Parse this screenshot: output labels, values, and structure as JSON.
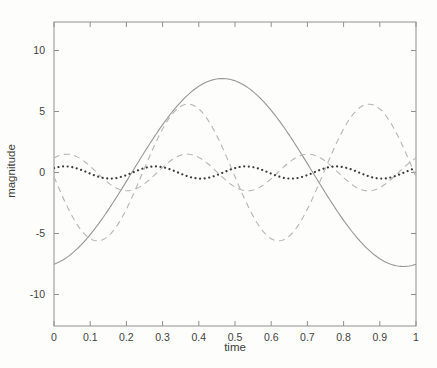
{
  "figure": {
    "background_color": "#fdfdfb",
    "axis_color": "#909090",
    "text_color": "#3d3d3d"
  },
  "chart_data": {
    "type": "line",
    "title": "",
    "xlabel": "time",
    "ylabel": "magnitude",
    "xlim": [
      0,
      1
    ],
    "ylim": [
      -12.5,
      12.3
    ],
    "grid": false,
    "legend": "none",
    "box": true,
    "tick_direction": "in",
    "x_tick_labels": [
      "0",
      "0.1",
      "0.2",
      "0.3",
      "0.4",
      "0.5",
      "0.6",
      "0.7",
      "0.8",
      "0.9",
      "1"
    ],
    "x_tick_values": [
      0,
      0.1,
      0.2,
      0.3,
      0.4,
      0.5,
      0.6,
      0.7,
      0.8,
      0.9,
      1
    ],
    "y_tick_labels": [
      "10",
      "5",
      "0",
      "-5",
      "-10"
    ],
    "y_tick_values": [
      10,
      5,
      0,
      -5,
      -10
    ],
    "model": "y = amplitude * sin(2*pi*frequency_hz*t + phase_rad), t in [0,1]",
    "series": [
      {
        "name": "sinusoid-1hz",
        "style": "solid",
        "color": "#969696",
        "amplitude": 7.7,
        "frequency_hz": 1,
        "phase_rad": -1.351,
        "samples_t": [
          0,
          0.05,
          0.1,
          0.15,
          0.2,
          0.25,
          0.3,
          0.35,
          0.4,
          0.45,
          0.5,
          0.55,
          0.6,
          0.65,
          0.7,
          0.75,
          0.8,
          0.85,
          0.9,
          0.95,
          1
        ],
        "samples_y": [
          -7.52,
          -6.63,
          -5.09,
          -3.06,
          -0.73,
          1.68,
          3.92,
          5.77,
          7.07,
          7.67,
          7.51,
          6.63,
          5.09,
          3.06,
          0.73,
          -1.68,
          -3.92,
          -5.77,
          -7.07,
          -7.67,
          -7.52
        ]
      },
      {
        "name": "sinusoid-2hz",
        "style": "dashed",
        "color": "#b5b5b5",
        "amplitude": 5.6,
        "frequency_hz": 2,
        "phase_rad": -3.079,
        "samples_t": [
          0,
          0.05,
          0.1,
          0.15,
          0.2,
          0.25,
          0.3,
          0.35,
          0.4,
          0.45,
          0.5,
          0.55,
          0.6,
          0.65,
          0.7,
          0.75,
          0.8,
          0.85,
          0.9,
          0.95,
          1
        ],
        "samples_y": [
          -0.35,
          -3.57,
          -5.42,
          -5.21,
          -3.0,
          0.35,
          3.57,
          5.42,
          5.21,
          3.0,
          -0.35,
          -3.57,
          -5.42,
          -5.21,
          -3.0,
          0.35,
          3.57,
          5.42,
          5.21,
          3.0,
          -0.35
        ]
      },
      {
        "name": "sinusoid-3hz",
        "style": "dashed",
        "color": "#b5b5b5",
        "amplitude": 1.5,
        "frequency_hz": 3,
        "phase_rad": 0.911,
        "samples_t": [
          0,
          0.05,
          0.1,
          0.15,
          0.2,
          0.25,
          0.3,
          0.35,
          0.4,
          0.45,
          0.5,
          0.55,
          0.6,
          0.65,
          0.7,
          0.75,
          0.8,
          0.85,
          0.9,
          0.95,
          1
        ],
        "samples_y": [
          1.19,
          1.44,
          0.51,
          -0.84,
          -1.5,
          -0.94,
          0.42,
          1.41,
          1.24,
          0.05,
          -1.19,
          -1.44,
          -0.51,
          0.84,
          1.5,
          0.92,
          -0.42,
          -1.41,
          -1.24,
          -0.05,
          1.19
        ]
      },
      {
        "name": "sinusoid-4hz",
        "style": "dotted",
        "color": "#3c3c3c",
        "amplitude": 0.5,
        "frequency_hz": 4,
        "phase_rad": 0.817,
        "samples_t": [
          0,
          0.05,
          0.1,
          0.15,
          0.2,
          0.25,
          0.3,
          0.35,
          0.4,
          0.45,
          0.5,
          0.55,
          0.6,
          0.65,
          0.7,
          0.75,
          0.8,
          0.85,
          0.9,
          0.95,
          1
        ],
        "samples_y": [
          0.36,
          0.44,
          -0.09,
          -0.5,
          -0.21,
          0.36,
          0.44,
          -0.09,
          -0.5,
          -0.21,
          0.36,
          0.44,
          -0.09,
          -0.5,
          -0.21,
          0.36,
          0.44,
          -0.09,
          -0.5,
          -0.21,
          0.36
        ]
      }
    ]
  }
}
